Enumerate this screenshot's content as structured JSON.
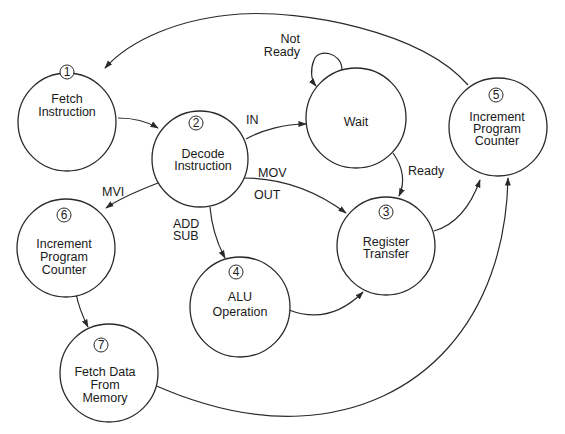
{
  "diagram": {
    "type": "state-diagram",
    "colors": {
      "stroke": "#2a2a2a",
      "text": "#1a1a1a",
      "background": "#ffffff"
    },
    "nodes": [
      {
        "id": "1",
        "number": "1",
        "lines": [
          "Fetch",
          "Instruction"
        ]
      },
      {
        "id": "2",
        "number": "2",
        "lines": [
          "Decode",
          "Instruction"
        ]
      },
      {
        "id": "wait",
        "number": "",
        "lines": [
          "Wait"
        ]
      },
      {
        "id": "3",
        "number": "3",
        "lines": [
          "Register",
          "Transfer"
        ]
      },
      {
        "id": "4",
        "number": "4",
        "lines": [
          "ALU",
          "Operation"
        ]
      },
      {
        "id": "5",
        "number": "5",
        "lines": [
          "Increment",
          "Program",
          "Counter"
        ]
      },
      {
        "id": "6",
        "number": "6",
        "lines": [
          "Increment",
          "Program",
          "Counter"
        ]
      },
      {
        "id": "7",
        "number": "7",
        "lines": [
          "Fetch Data",
          "From",
          "Memory"
        ]
      }
    ],
    "edges": [
      {
        "from": "1",
        "to": "2",
        "label": ""
      },
      {
        "from": "2",
        "to": "wait",
        "label": "IN"
      },
      {
        "from": "wait",
        "to": "wait",
        "label": "Not Ready",
        "label_lines": [
          "Not",
          "Ready"
        ]
      },
      {
        "from": "wait",
        "to": "3",
        "label": "Ready"
      },
      {
        "from": "2",
        "to": "3",
        "label": "MOV / OUT",
        "label_lines": [
          "MOV",
          "OUT"
        ]
      },
      {
        "from": "2",
        "to": "6",
        "label": "MVI"
      },
      {
        "from": "2",
        "to": "4",
        "label": "ADD / SUB",
        "label_lines": [
          "ADD",
          "SUB"
        ]
      },
      {
        "from": "4",
        "to": "3",
        "label": ""
      },
      {
        "from": "3",
        "to": "5",
        "label": ""
      },
      {
        "from": "6",
        "to": "7",
        "label": ""
      },
      {
        "from": "7",
        "to": "5",
        "label": ""
      },
      {
        "from": "5",
        "to": "1",
        "label": ""
      }
    ]
  }
}
